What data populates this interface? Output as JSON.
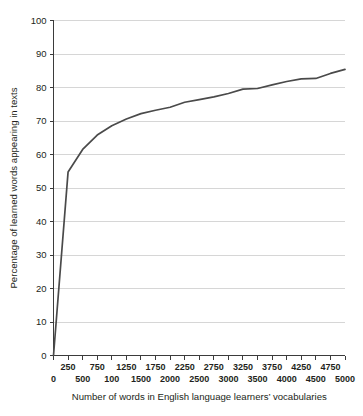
{
  "figure": {
    "top_artifact_text": "",
    "background": "#ffffff",
    "line_color": "#4a4a4a",
    "grid_color": "#d2d2d2",
    "axis_color": "#3b3b3b"
  },
  "chart_data": {
    "type": "line",
    "title": "",
    "xlabel": "Number of words in English language learners’ vocabularies",
    "ylabel": "Percentage of learned words appearing in texts",
    "xlim": [
      0,
      5000
    ],
    "ylim": [
      0,
      100
    ],
    "grid": true,
    "grid_axis": "y",
    "legend": "none",
    "ytick_labels": [
      "0",
      "10",
      "20",
      "30",
      "40",
      "50",
      "60",
      "70",
      "80",
      "90",
      "100"
    ],
    "ytick_values": [
      0,
      10,
      20,
      30,
      40,
      50,
      60,
      70,
      80,
      90,
      100
    ],
    "xtick_values": [
      0,
      250,
      500,
      750,
      1000,
      1250,
      1500,
      1750,
      2000,
      2250,
      2500,
      2750,
      3000,
      3250,
      3500,
      3750,
      4000,
      4250,
      4500,
      4750,
      5000
    ],
    "xtick_labels_upper_row": [
      "250",
      "750",
      "1250",
      "1750",
      "2250",
      "2750",
      "3250",
      "3750",
      "4250",
      "4750"
    ],
    "xtick_values_upper_row": [
      250,
      750,
      1250,
      1750,
      2250,
      2750,
      3250,
      3750,
      4250,
      4750
    ],
    "xtick_labels_lower_row": [
      "0",
      "500",
      "100",
      "1500",
      "2000",
      "2500",
      "3000",
      "3500",
      "4000",
      "4500",
      "5000"
    ],
    "xtick_values_lower_row": [
      0,
      500,
      1000,
      1500,
      2000,
      2500,
      3000,
      3500,
      4000,
      4500,
      5000
    ],
    "x": [
      0,
      250,
      500,
      750,
      1000,
      1250,
      1500,
      1750,
      2000,
      2250,
      2500,
      2750,
      3000,
      3250,
      3500,
      3750,
      4000,
      4250,
      4500,
      4750,
      5000
    ],
    "values": [
      0,
      54.8,
      61.5,
      65.8,
      68.6,
      70.6,
      72.2,
      73.2,
      74.1,
      75.6,
      76.4,
      77.2,
      78.2,
      79.5,
      79.7,
      80.8,
      81.8,
      82.6,
      82.7,
      84.2,
      85.4
    ],
    "series": [
      {
        "name": "Percentage of learned words appearing in texts",
        "values": [
          0,
          54.8,
          61.5,
          65.8,
          68.6,
          70.6,
          72.2,
          73.2,
          74.1,
          75.6,
          76.4,
          77.2,
          78.2,
          79.5,
          79.7,
          80.8,
          81.8,
          82.6,
          82.7,
          84.2,
          85.4
        ]
      }
    ]
  }
}
